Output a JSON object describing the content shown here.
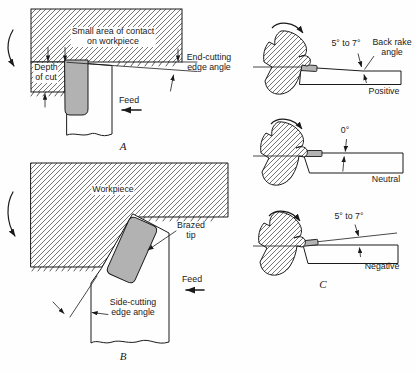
{
  "figure": {
    "panel_a": {
      "contact_note_line1": "Small area of contact",
      "contact_note_line2": "on workpiece",
      "depth_line1": "Depth",
      "depth_line2": "of cut",
      "end_cutting_line1": "End-cutting",
      "end_cutting_line2": "edge angle",
      "feed_label": "Feed",
      "letter": "A"
    },
    "panel_b": {
      "workpiece_label": "Workpiece",
      "brazed_line1": "Brazed",
      "brazed_line2": "tip",
      "side_cutting_line1": "Side-cutting",
      "side_cutting_line2": "edge angle",
      "feed_label": "Feed",
      "letter": "B"
    },
    "panel_c": {
      "positive": {
        "angle": "5° to 7°",
        "rake_line1": "Back rake",
        "rake_line2": "angle",
        "name": "Positive"
      },
      "neutral": {
        "angle": "0°",
        "name": "Neutral"
      },
      "negative": {
        "angle": "5° to 7°",
        "name": "Negative"
      },
      "letter": "C"
    },
    "colors": {
      "tip_gray": "#b2b2b2",
      "line": "#1a1a1a",
      "background": "#fefefe"
    }
  }
}
